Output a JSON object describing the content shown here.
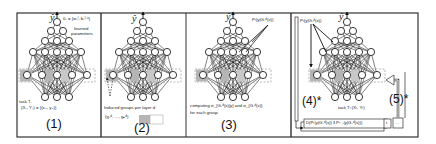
{
  "figure": {
    "panels": [
      {
        "id": 1,
        "step_label": "(1)",
        "output_label": "ŷ",
        "params_formula": "θ₁ = {w₁ˡ, b₁ˡ⁺¹}",
        "params_note_line1": "learned",
        "params_note_line2": "parameters",
        "task_line1": "task T₁",
        "task_line2": "(X₁, Y₁) = {(x₁ᵢ, y₁ᵢ)}"
      },
      {
        "id": 2,
        "step_label": "(2)",
        "output_label": "ŷ",
        "caption_line1": "Induced groups per layer  d",
        "caption_line2": "(g₁ᵈ, …, gₙᵈ)"
      },
      {
        "id": 3,
        "step_label": "(3)",
        "output_label": "ŷ",
        "prob_label": "Pₜ(y|G₁ᵈ(x))",
        "caption_line1": "computing σ_{G₁ᵈ(x)|y} and σ_{G₁ᵈ(x)}",
        "caption_line2": "for each group"
      },
      {
        "id": 4,
        "step_label": "(4)*",
        "step5_label": "(5)*",
        "output_label": "ŷ",
        "prob_label": "Pₜ(y|G₁ᵈ(x))",
        "task_label": "task Tₜ  (Xₜ, Yₜ)",
        "loop_formula": "D(Pₜ(y|G₁ᵈ(x)) ‖ Pₜ₋₁(y|G₁ᵈ(x)))",
        "loop_cell_2": "t",
        "loop_cell_3": "..."
      }
    ],
    "colors": {
      "border": "#333333",
      "node_stroke": "#222222",
      "edge": "#1a1a1a",
      "group_fill": "#b5b5b5",
      "group_dashed": "#999999"
    }
  }
}
